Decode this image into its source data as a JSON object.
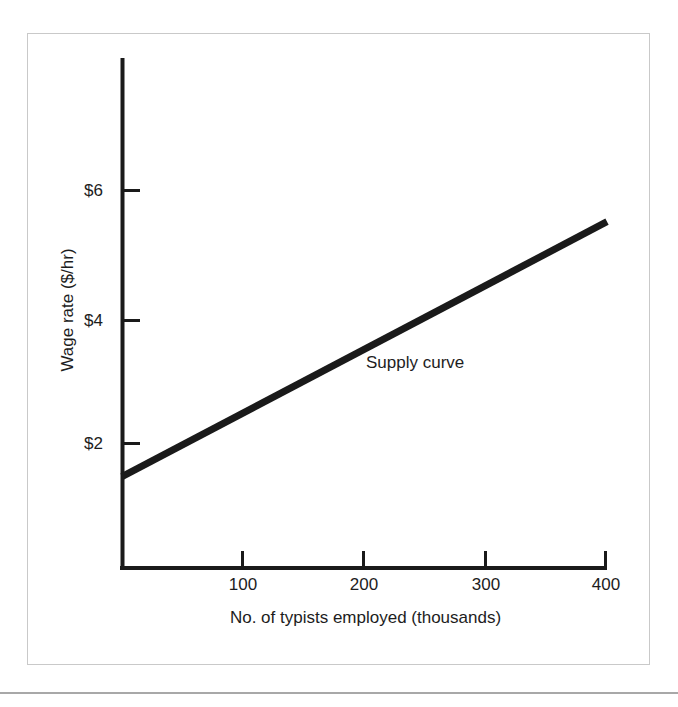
{
  "figure": {
    "frame_color": "#c9c9c9",
    "rule_color": "#a8a8a8",
    "background": "#ffffff"
  },
  "chart_data": {
    "type": "line",
    "title": "",
    "subtitle": "",
    "xlabel": "No. of typists employed (thousands)",
    "ylabel": "Wage rate ($/hr)",
    "xlim": [
      0,
      400
    ],
    "ylim": [
      0,
      8.1
    ],
    "grid": false,
    "legend_position": "inline-annotation",
    "x_ticks": [
      {
        "value": 100,
        "label": "100"
      },
      {
        "value": 200,
        "label": "200"
      },
      {
        "value": 300,
        "label": "300"
      },
      {
        "value": 400,
        "label": "400"
      }
    ],
    "y_ticks": [
      {
        "value": 2,
        "label": "$2"
      },
      {
        "value": 4,
        "label": "$4"
      },
      {
        "value": 6,
        "label": "$6"
      }
    ],
    "series": [
      {
        "name": "Supply curve",
        "color": "#1a1a1a",
        "line_width": 7,
        "x": [
          0,
          100,
          200,
          300,
          400
        ],
        "values": [
          1.45,
          2.47,
          3.48,
          4.49,
          5.5
        ]
      }
    ],
    "annotations": [
      {
        "text": "Supply curve",
        "x": 200,
        "y": 3.1
      }
    ]
  },
  "axes": {
    "y_axis_name": "wage-rate-axis",
    "x_axis_name": "typists-employed-axis"
  }
}
